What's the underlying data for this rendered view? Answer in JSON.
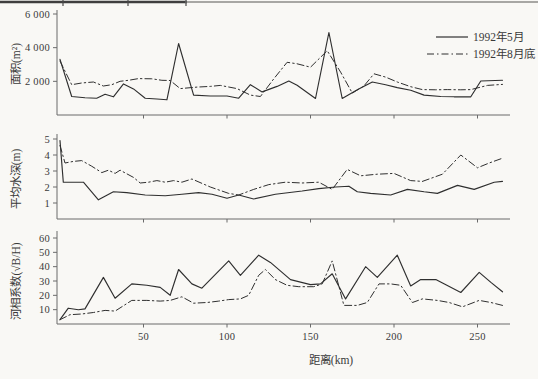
{
  "legend": {
    "items": [
      {
        "label": "1992年5月",
        "style": "solid"
      },
      {
        "label": "1992年8月底",
        "style": "dashed"
      }
    ]
  },
  "chart_data": [
    {
      "type": "line",
      "title": "",
      "ylabel": "面积(m²)",
      "ylim": [
        0,
        6000
      ],
      "ytick_values": [
        2000,
        4000,
        6000
      ],
      "ytick_labels": [
        "2 000",
        "4 000",
        "6 000"
      ],
      "xlim": [
        0,
        268
      ],
      "xtick_values": [
        50,
        100,
        150,
        200,
        250
      ],
      "grid": false,
      "legend_position": "upper right",
      "series": [
        {
          "name": "1992年5月",
          "style": "solid",
          "x": [
            0,
            7,
            15,
            22,
            27,
            32,
            38,
            44,
            51,
            58,
            64,
            71,
            80,
            90,
            100,
            107,
            114,
            121,
            130,
            137,
            142,
            153,
            161,
            169,
            178,
            187,
            195,
            202,
            210,
            218,
            228,
            236,
            246,
            252,
            265
          ],
          "y": [
            3300,
            1100,
            1030,
            1000,
            1230,
            1080,
            1850,
            1550,
            1000,
            950,
            900,
            4250,
            1180,
            1130,
            1130,
            1000,
            1800,
            1370,
            1700,
            2020,
            1770,
            980,
            4900,
            980,
            1500,
            1960,
            1800,
            1630,
            1470,
            1180,
            1100,
            1080,
            1080,
            2020,
            2060
          ]
        },
        {
          "name": "1992年8月底",
          "style": "dashed",
          "x": [
            0,
            7,
            13,
            20,
            26,
            31,
            36,
            41,
            47,
            55,
            61,
            66,
            72,
            82,
            90,
            96,
            106,
            114,
            120,
            128,
            136,
            142,
            150,
            160,
            168,
            175,
            182,
            188,
            195,
            202,
            210,
            217,
            225,
            232,
            240,
            246,
            256,
            265
          ],
          "y": [
            3200,
            1800,
            1900,
            1960,
            1720,
            1800,
            2000,
            2060,
            2160,
            2150,
            2060,
            2050,
            1570,
            1660,
            1700,
            1760,
            1570,
            1180,
            1100,
            2150,
            3130,
            3040,
            2840,
            3820,
            2550,
            1300,
            1720,
            2450,
            2250,
            1960,
            1680,
            1510,
            1500,
            1510,
            1500,
            1510,
            1760,
            1820
          ]
        }
      ]
    },
    {
      "type": "line",
      "title": "",
      "ylabel": "平均水深(m)",
      "ylim": [
        0,
        5
      ],
      "ytick_values": [
        1,
        2,
        3,
        4,
        5
      ],
      "ytick_labels": [
        "1",
        "2",
        "3",
        "4",
        "5"
      ],
      "xlim": [
        0,
        268
      ],
      "xtick_values": [
        50,
        100,
        150,
        200,
        250
      ],
      "grid": false,
      "series": [
        {
          "name": "1992年5月",
          "style": "solid",
          "x": [
            0,
            2,
            14,
            23,
            32,
            40,
            51,
            63,
            73,
            83,
            91,
            100,
            107,
            116,
            129,
            145,
            155,
            165,
            173,
            178,
            186,
            198,
            208,
            218,
            226,
            238,
            248,
            260,
            265
          ],
          "y": [
            4.9,
            2.3,
            2.3,
            1.2,
            1.7,
            1.65,
            1.5,
            1.45,
            1.55,
            1.65,
            1.55,
            1.3,
            1.5,
            1.25,
            1.55,
            1.75,
            1.9,
            2.0,
            2.05,
            1.7,
            1.6,
            1.5,
            1.85,
            1.7,
            1.6,
            2.1,
            1.85,
            2.3,
            2.35
          ]
        },
        {
          "name": "1992年8月底",
          "style": "dashed",
          "x": [
            0,
            3,
            8,
            13,
            19,
            25,
            29,
            33,
            36,
            44,
            48,
            53,
            58,
            63,
            68,
            73,
            79,
            90,
            101,
            107,
            116,
            125,
            135,
            145,
            155,
            163,
            172,
            180,
            190,
            200,
            210,
            217,
            229,
            240,
            250,
            257,
            265
          ],
          "y": [
            4.6,
            3.5,
            3.6,
            3.65,
            3.3,
            2.9,
            3.05,
            2.85,
            3.05,
            2.6,
            2.25,
            2.3,
            2.4,
            2.3,
            2.4,
            2.3,
            2.5,
            2.0,
            1.6,
            1.5,
            1.85,
            2.15,
            2.3,
            2.25,
            2.3,
            1.85,
            3.1,
            2.7,
            2.8,
            2.85,
            2.4,
            2.35,
            2.8,
            4.0,
            3.2,
            3.5,
            3.8
          ]
        }
      ]
    },
    {
      "type": "line",
      "title": "",
      "ylabel": "河相系数(√B/H)",
      "xlabel": "距离(km)",
      "ylim": [
        0,
        60
      ],
      "ytick_values": [
        10,
        20,
        30,
        40,
        50,
        60
      ],
      "ytick_labels": [
        "10",
        "20",
        "30",
        "40",
        "50",
        "60"
      ],
      "xlim": [
        0,
        268
      ],
      "xtick_values": [
        50,
        100,
        150,
        200,
        250
      ],
      "xtick_labels": [
        "50",
        "100",
        "150",
        "200",
        "250"
      ],
      "grid": false,
      "series": [
        {
          "name": "1992年5月",
          "style": "solid",
          "x": [
            0,
            5,
            11,
            15,
            26,
            33,
            43,
            52,
            60,
            66,
            71,
            79,
            85,
            101,
            108,
            119,
            126,
            138,
            150,
            156,
            163,
            171,
            183,
            190,
            202,
            210,
            216,
            225,
            240,
            251,
            258,
            265
          ],
          "y": [
            3,
            11,
            10,
            10.5,
            32.5,
            18,
            28,
            27,
            25.5,
            20,
            38,
            28,
            25,
            44,
            34,
            48,
            43,
            31,
            27.5,
            28,
            35,
            17.5,
            40,
            32.5,
            48,
            26.5,
            31,
            31,
            22,
            36,
            29,
            22.5
          ]
        },
        {
          "name": "1992年8月底",
          "style": "dashed",
          "x": [
            0,
            6,
            13,
            20,
            27,
            33,
            43,
            52,
            60,
            66,
            73,
            80,
            88,
            95,
            101,
            108,
            113,
            119,
            123,
            129,
            136,
            143,
            152,
            157,
            163,
            170,
            178,
            184,
            191,
            198,
            204,
            211,
            217,
            226,
            233,
            241,
            251,
            258,
            265
          ],
          "y": [
            3,
            6.5,
            7,
            8,
            9.5,
            9,
            16.5,
            16.5,
            16,
            16.5,
            19,
            14.5,
            15,
            16,
            17,
            17.5,
            20,
            34,
            38,
            31,
            27,
            26,
            26,
            28,
            44,
            13,
            13,
            15,
            28,
            28,
            27,
            15,
            17.5,
            16.5,
            15,
            12,
            16.5,
            15,
            13
          ]
        }
      ]
    }
  ]
}
